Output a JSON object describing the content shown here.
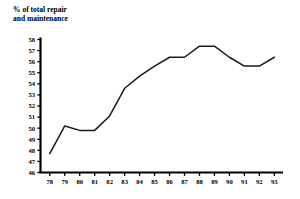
{
  "chart_data": {
    "type": "line",
    "title": "% of total repair\nand maintenance",
    "xlabel": "",
    "ylabel": "% of total repair and maintenance",
    "categories": [
      "78",
      "79",
      "80",
      "81",
      "82",
      "83",
      "84",
      "85",
      "86",
      "87",
      "88",
      "89",
      "90",
      "91",
      "92",
      "93"
    ],
    "values": [
      47.7,
      50.2,
      49.8,
      49.8,
      51.1,
      53.6,
      54.7,
      55.6,
      56.4,
      56.4,
      57.4,
      57.4,
      56.4,
      55.6,
      55.6,
      56.4
    ],
    "ylim": [
      46,
      58
    ],
    "ytick_labels": [
      "46",
      "47",
      "48",
      "49",
      "50",
      "51",
      "52",
      "53",
      "54",
      "55",
      "56",
      "57",
      "58"
    ],
    "ytick_values": [
      46,
      47,
      48,
      49,
      50,
      51,
      52,
      53,
      54,
      55,
      56,
      57,
      58
    ],
    "xtick_labels": [
      "78",
      "79",
      "80",
      "81",
      "82",
      "83",
      "84",
      "85",
      "86",
      "87",
      "88",
      "89",
      "90",
      "91",
      "92",
      "93"
    ],
    "grid": false,
    "legend": null,
    "series_color": "#1a1a1a",
    "axis_color": "#000000",
    "background_color": "#ffffff"
  }
}
